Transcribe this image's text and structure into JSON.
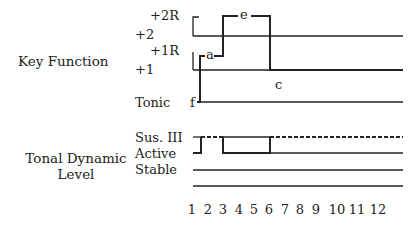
{
  "sections": {
    "key_function": "Key Function",
    "tonal_dynamic_line1": "Tonal Dynamic",
    "tonal_dynamic_line2": "Level"
  },
  "key_levels": {
    "plus2R": "+2R",
    "plus2": "+2",
    "plus1R": "+1R",
    "plus1": "+1",
    "tonic": "Tonic"
  },
  "dynamic_levels": {
    "sus3": "Sus. III",
    "active": "Active",
    "stable": "Stable"
  },
  "point_labels": {
    "f": "f",
    "a": "a",
    "e": "e",
    "c": "c"
  },
  "x_ticks": [
    "1",
    "2",
    "3",
    "4",
    "5",
    "6",
    "7",
    "8",
    "9",
    "10",
    "11",
    "12"
  ],
  "x_tick_positions": [
    192,
    208,
    223,
    239,
    254,
    269,
    285,
    300,
    316,
    337,
    357,
    378
  ],
  "colors": {
    "line": "#222222",
    "text": "#222222"
  }
}
